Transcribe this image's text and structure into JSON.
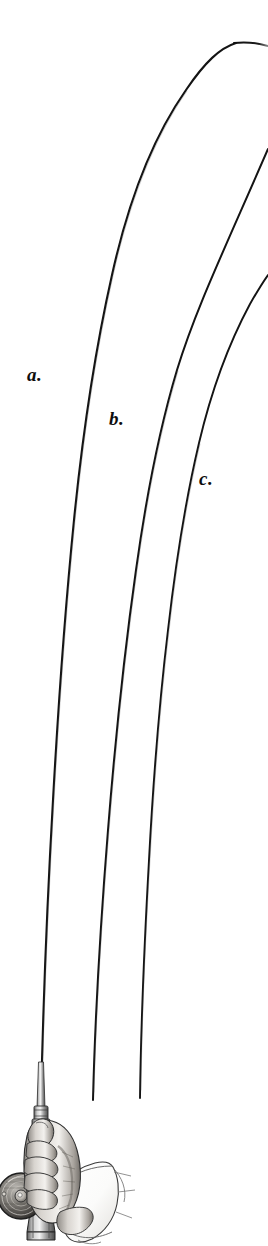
{
  "plate": {
    "title": "Comparative Rod Actions",
    "medium": "engraving",
    "background_color": "#ffffff",
    "ink_color": "#111111",
    "width": 268,
    "height": 1246
  },
  "labels": [
    {
      "id": "a",
      "text": "a.",
      "x": 27,
      "y": 365,
      "refers_to": "slow-full-action-rod"
    },
    {
      "id": "b",
      "text": "b.",
      "x": 109,
      "y": 409,
      "refers_to": "medium-action-rod"
    },
    {
      "id": "c",
      "text": "c.",
      "x": 199,
      "y": 469,
      "refers_to": "fast-tip-action-rod"
    }
  ],
  "curves": [
    {
      "id": "a",
      "name": "rod-curve-a",
      "label": "a.",
      "description": "deepest bending rod, arcs over and tip exits at upper right",
      "stroke": "#111111",
      "points": [
        [
          41,
          1100
        ],
        [
          44,
          980
        ],
        [
          48,
          860
        ],
        [
          53,
          740
        ],
        [
          60,
          620
        ],
        [
          68,
          500
        ],
        [
          78,
          400
        ],
        [
          92,
          300
        ],
        [
          110,
          210
        ],
        [
          134,
          140
        ],
        [
          166,
          80
        ],
        [
          200,
          50
        ],
        [
          230,
          42
        ],
        [
          268,
          46
        ]
      ]
    },
    {
      "id": "b",
      "name": "rod-curve-b",
      "label": "b.",
      "description": "medium bend, shorter visible butt, tip exits right edge higher up",
      "stroke": "#111111",
      "points": [
        [
          93,
          1100
        ],
        [
          97,
          1000
        ],
        [
          103,
          900
        ],
        [
          110,
          800
        ],
        [
          118,
          700
        ],
        [
          127,
          600
        ],
        [
          137,
          500
        ],
        [
          148,
          415
        ],
        [
          163,
          335
        ],
        [
          182,
          268
        ],
        [
          207,
          210
        ],
        [
          236,
          168
        ],
        [
          268,
          150
        ]
      ]
    },
    {
      "id": "c",
      "name": "rod-curve-c",
      "label": "c.",
      "description": "shallowest bend, tip exits right edge at upper-middle",
      "stroke": "#111111",
      "points": [
        [
          140,
          1098
        ],
        [
          142,
          1010
        ],
        [
          145,
          920
        ],
        [
          149,
          830
        ],
        [
          155,
          740
        ],
        [
          162,
          650
        ],
        [
          170,
          565
        ],
        [
          180,
          490
        ],
        [
          193,
          425
        ],
        [
          210,
          368
        ],
        [
          232,
          320
        ],
        [
          256,
          286
        ],
        [
          268,
          276
        ]
      ]
    }
  ],
  "handle": {
    "name": "rod-handle-assembly",
    "parts": [
      {
        "name": "rod-butt-section",
        "description": "tapered cane butt above grip"
      },
      {
        "name": "ferrule",
        "description": "metal ferrule band"
      },
      {
        "name": "cork-grip",
        "description": "grip held in the fist"
      },
      {
        "name": "reel-seat",
        "description": "metal reel seat below grip"
      },
      {
        "name": "butt-cap",
        "description": "flared metal butt cap"
      }
    ]
  },
  "reel": {
    "name": "fly-reel",
    "description": "side-plate fly reel, concentric rings with central hub",
    "center_x": 21,
    "center_y": 1196,
    "radius": 23
  },
  "hand": {
    "name": "gripping-hand",
    "description": "right hand closed around the cork grip, thumb on top",
    "cuff": {
      "name": "shirt-cuff",
      "description": "white shirt cuff at the wrist"
    }
  }
}
